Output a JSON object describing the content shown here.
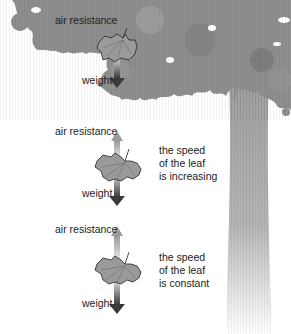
{
  "diagram": {
    "panels": [
      {
        "air_resistance_label": "air resistance",
        "weight_label": "weight",
        "description": ""
      },
      {
        "air_resistance_label": "air resistance",
        "weight_label": "weight",
        "description_lines": [
          "the speed",
          "of the leaf",
          "is increasing"
        ]
      },
      {
        "air_resistance_label": "air resistance",
        "weight_label": "weight",
        "description_lines": [
          "the speed",
          "of the leaf",
          "is constant"
        ]
      }
    ]
  },
  "colors": {
    "tree_foliage": "#8a8a8a",
    "tree_trunk": "#a8a8a8",
    "leaf_fill": "#9a9a9a",
    "arrow_dark": "#3a3a3a",
    "arrow_light": "#c8c8c8",
    "text": "#222222"
  }
}
